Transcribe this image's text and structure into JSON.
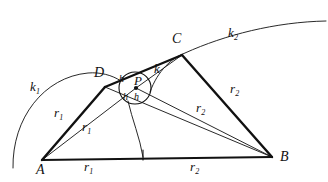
{
  "figure": {
    "background_color": "#ffffff",
    "stroke_color": "#111111",
    "width": 328,
    "height": 182
  },
  "points": {
    "A": {
      "label": "A",
      "x": 42,
      "y": 160,
      "label_x": 36,
      "label_y": 163
    },
    "B": {
      "label": "B",
      "x": 272,
      "y": 157,
      "label_x": 280,
      "label_y": 160
    },
    "C": {
      "label": "C",
      "x": 182,
      "y": 55,
      "label_x": 172,
      "label_y": 40
    },
    "D": {
      "label": "D",
      "x": 105,
      "y": 87,
      "label_x": 96,
      "label_y": 73
    },
    "P": {
      "label": "P",
      "x": 136,
      "y": 88,
      "label_x": 134,
      "label_y": 80
    },
    "F": {
      "label": "",
      "x": 143,
      "y": 157
    }
  },
  "circle": {
    "name": "k",
    "label": "k",
    "center_x": 135,
    "center_y": 88,
    "radius": 16,
    "label_x": 155,
    "label_y": 66
  },
  "arcs": {
    "k1": {
      "label": "k",
      "subscript": "1",
      "label_x": 30,
      "label_y": 84
    },
    "k2": {
      "label": "k",
      "subscript": "2",
      "label_x": 228,
      "label_y": 30
    }
  },
  "segment_labels": [
    {
      "id": "r1-AD",
      "text": "r",
      "subscript": "1",
      "x": 56,
      "y": 112
    },
    {
      "id": "r1-AP",
      "text": "r",
      "subscript": "1",
      "x": 84,
      "y": 124
    },
    {
      "id": "r1-base",
      "text": "r",
      "subscript": "1",
      "x": 85,
      "y": 163
    },
    {
      "id": "r2-CB",
      "text": "r",
      "subscript": "2",
      "x": 232,
      "y": 88
    },
    {
      "id": "r2-PB",
      "text": "r",
      "subscript": "2",
      "x": 198,
      "y": 106
    },
    {
      "id": "r2-base",
      "text": "r",
      "subscript": "2",
      "x": 192,
      "y": 163
    }
  ],
  "height_labels": [
    {
      "id": "h-upper-left",
      "text": "h",
      "x": 120,
      "y": 78
    },
    {
      "id": "h-lower-left",
      "text": "h",
      "x": 124,
      "y": 97
    },
    {
      "id": "h-lower-right",
      "text": "h",
      "x": 136,
      "y": 96
    }
  ]
}
